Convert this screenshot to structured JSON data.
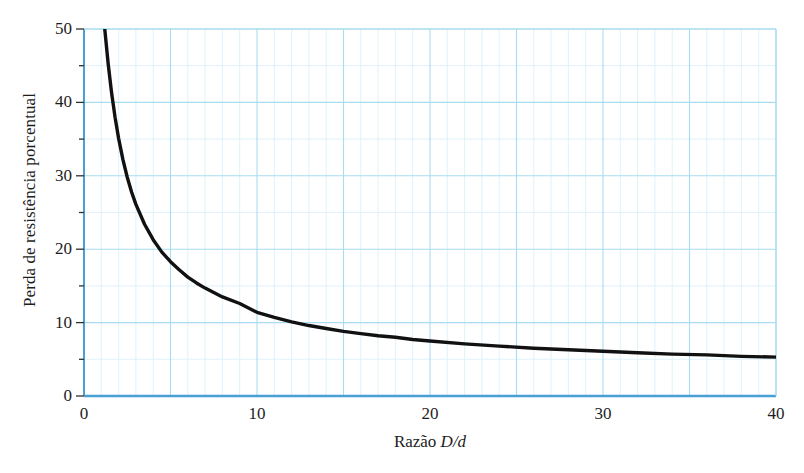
{
  "chart_data": {
    "type": "line",
    "title": "",
    "xlabel_prefix": "Razão ",
    "xlabel_symbol": "D/d",
    "xlabel": "Razão D/d",
    "ylabel": "Perda de resistência porcentual",
    "xlim": [
      0,
      40
    ],
    "ylim": [
      0,
      50
    ],
    "xticks": [
      0,
      10,
      20,
      30,
      40
    ],
    "xtick_labels": [
      "0",
      "10",
      "20",
      "30",
      "40"
    ],
    "yticks": [
      0,
      10,
      20,
      30,
      40,
      50
    ],
    "ytick_labels": [
      "0",
      "10",
      "20",
      "30",
      "40",
      "50"
    ],
    "x_minor_step": 1,
    "x_major_step": 5,
    "y_minor_step": 5,
    "y_major_step": 10,
    "grid": true,
    "grid_color_minor": "#ddf0fa",
    "grid_color_major": "#a8dcf0",
    "axis_color": "#4a9fd4",
    "curve_color": "#111111",
    "curve_width": 3.4,
    "legend": "none",
    "series": [
      {
        "name": "Perda de resistência porcentual",
        "x": [
          1.2,
          1.4,
          1.6,
          1.8,
          2.0,
          2.25,
          2.5,
          2.75,
          3.0,
          3.5,
          4.0,
          4.5,
          5.0,
          5.5,
          6.0,
          6.5,
          7.0,
          7.5,
          8.0,
          9.0,
          10.0,
          11.0,
          12.0,
          13.0,
          14.0,
          15.0,
          16.0,
          17.0,
          18.0,
          19.0,
          20.0,
          22.0,
          24.0,
          26.0,
          28.0,
          30.0,
          32.0,
          34.0,
          36.0,
          38.0,
          40.0
        ],
        "y": [
          50.0,
          45.2,
          41.2,
          37.9,
          35.1,
          32.2,
          29.8,
          27.8,
          26.1,
          23.4,
          21.3,
          19.6,
          18.3,
          17.2,
          16.2,
          15.4,
          14.7,
          14.1,
          13.5,
          12.6,
          11.4,
          10.7,
          10.1,
          9.6,
          9.2,
          8.8,
          8.5,
          8.2,
          8.0,
          7.7,
          7.5,
          7.1,
          6.8,
          6.5,
          6.3,
          6.1,
          5.9,
          5.7,
          5.6,
          5.4,
          5.3
        ]
      }
    ]
  },
  "axis_labels": {
    "y_title": "Perda de resistência porcentual",
    "x_title_prefix": "Razão ",
    "x_title_symbol": "D/d"
  }
}
